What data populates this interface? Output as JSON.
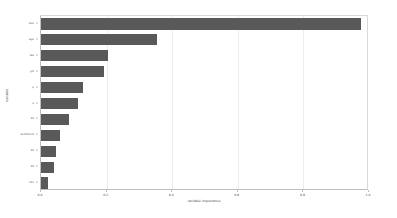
{
  "chart_data": {
    "type": "bar",
    "orientation": "horizontal",
    "title": "",
    "xlabel": "variable importance",
    "ylabel": "variable",
    "xlim": [
      0.0,
      1.0
    ],
    "xticks": [
      "0.0",
      "0.2",
      "0.4",
      "0.6",
      "0.8",
      "1.0"
    ],
    "xtickvalues": [
      0.0,
      0.2,
      0.4,
      0.6,
      0.8,
      1.0
    ],
    "grid": "vertical",
    "legend": "none",
    "bar_color": "#595959",
    "panel_color": "#ffffff",
    "grid_color": "#ededed",
    "axis_color": "#bdbdbd",
    "categories": [
      "size",
      "age",
      "tax",
      "yrs",
      "p",
      "q",
      "d1",
      "sentiment",
      "d2",
      "d3",
      "n1n"
    ],
    "values": [
      0.975,
      0.355,
      0.205,
      0.192,
      0.128,
      0.112,
      0.085,
      0.058,
      0.047,
      0.04,
      0.022
    ]
  }
}
